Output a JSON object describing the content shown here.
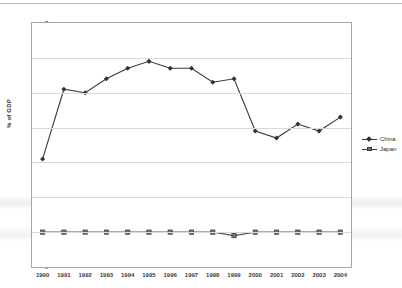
{
  "chart_data": {
    "type": "line",
    "title": "",
    "xlabel": "",
    "ylabel": "% of GDP",
    "categories": [
      "1990",
      "1991",
      "1992",
      "1993",
      "1994",
      "1995",
      "1996",
      "1997",
      "1998",
      "1999",
      "2000",
      "2001",
      "2002",
      "2003",
      "2004"
    ],
    "series": [
      {
        "name": "China",
        "marker": "diamond",
        "color": "#333333",
        "values": [
          3.1,
          5.1,
          5.0,
          5.4,
          5.7,
          5.9,
          5.7,
          5.7,
          5.3,
          5.4,
          3.9,
          3.7,
          4.1,
          3.9,
          4.3
        ]
      },
      {
        "name": "Japan",
        "marker": "square",
        "color": "#6e6e6e",
        "values": [
          1.0,
          1.0,
          1.0,
          1.0,
          1.0,
          1.0,
          1.0,
          1.0,
          1.0,
          0.9,
          1.0,
          1.0,
          1.0,
          1.0,
          1.0
        ]
      }
    ],
    "ylim": [
      0,
      7
    ],
    "yticks": [
      0,
      1,
      2,
      3,
      4,
      5,
      6,
      7
    ],
    "ytick_labels": [
      "0",
      "1",
      "2",
      "3",
      "4",
      "5",
      "6",
      "7"
    ],
    "grid": true,
    "grid_axis": "y",
    "legend_position": "right"
  },
  "colors": {
    "china_line": "#3a3a3a",
    "japan_line": "#555555",
    "gridline": "#d9d9d9",
    "frame": "#a6a6a6",
    "text": "#3c3c3c",
    "background": "#ffffff"
  },
  "legend": {
    "entries": [
      {
        "label": "China",
        "marker": "diamond-marker-icon"
      },
      {
        "label": "Japan",
        "marker": "square-marker-icon"
      }
    ]
  }
}
